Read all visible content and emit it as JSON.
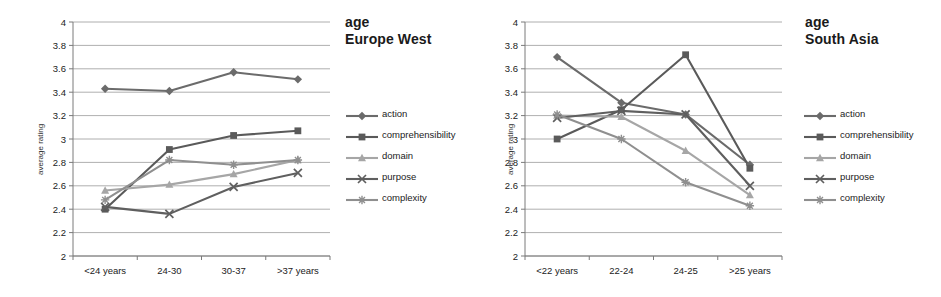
{
  "figure": {
    "panels": [
      {
        "id": "europe-west",
        "title_line1": "age",
        "title_line2": "Europe West"
      },
      {
        "id": "south-asia",
        "title_line1": "age",
        "title_line2": "South Asia"
      }
    ]
  },
  "legend": {
    "position": "right",
    "entries": [
      {
        "label": "action",
        "marker": "diamond",
        "color": "#6b6b6b"
      },
      {
        "label": "comprehensibility",
        "marker": "square",
        "color": "#5a5a5a"
      },
      {
        "label": "domain",
        "marker": "triangle",
        "color": "#a6a6a6"
      },
      {
        "label": "purpose",
        "marker": "cross",
        "color": "#5f5f5f"
      },
      {
        "label": "complexity",
        "marker": "asterisk",
        "color": "#8f8f8f"
      }
    ]
  },
  "chart_data": [
    {
      "type": "line",
      "title": "age Europe West",
      "xlabel": "",
      "ylabel": "average rating",
      "categories": [
        "<24 years",
        "24-30",
        "30-37",
        ">37 years"
      ],
      "ylim": [
        2,
        4
      ],
      "yticks": [
        "2",
        "2.2",
        "2.4",
        "2.6",
        "2.8",
        "3",
        "3.2",
        "3.4",
        "3.6",
        "3.8",
        "4"
      ],
      "ytick_values": [
        2,
        2.2,
        2.4,
        2.6,
        2.8,
        3,
        3.2,
        3.4,
        3.6,
        3.8,
        4
      ],
      "grid": true,
      "series": [
        {
          "name": "action",
          "marker": "diamond",
          "color": "#6b6b6b",
          "values": [
            3.43,
            3.41,
            3.57,
            3.51
          ]
        },
        {
          "name": "comprehensibility",
          "marker": "square",
          "color": "#5a5a5a",
          "values": [
            2.4,
            2.91,
            3.03,
            3.07
          ]
        },
        {
          "name": "domain",
          "marker": "triangle",
          "color": "#a6a6a6",
          "values": [
            2.56,
            2.61,
            2.7,
            2.82
          ]
        },
        {
          "name": "purpose",
          "marker": "cross",
          "color": "#5f5f5f",
          "values": [
            2.42,
            2.36,
            2.59,
            2.71
          ]
        },
        {
          "name": "complexity",
          "marker": "asterisk",
          "color": "#8f8f8f",
          "values": [
            2.48,
            2.82,
            2.78,
            2.82
          ]
        }
      ]
    },
    {
      "type": "line",
      "title": "age South Asia",
      "xlabel": "",
      "ylabel": "average rating",
      "categories": [
        "<22 years",
        "22-24",
        "24-25",
        ">25 years"
      ],
      "ylim": [
        2,
        4
      ],
      "yticks": [
        "2",
        "2.2",
        "2.4",
        "2.6",
        "2.8",
        "3",
        "3.2",
        "3.4",
        "3.6",
        "3.8",
        "4"
      ],
      "ytick_values": [
        2,
        2.2,
        2.4,
        2.6,
        2.8,
        3,
        3.2,
        3.4,
        3.6,
        3.8,
        4
      ],
      "grid": true,
      "series": [
        {
          "name": "action",
          "marker": "diamond",
          "color": "#6b6b6b",
          "values": [
            3.7,
            3.31,
            3.21,
            2.78
          ]
        },
        {
          "name": "comprehensibility",
          "marker": "square",
          "color": "#5a5a5a",
          "values": [
            3.0,
            3.25,
            3.72,
            2.75
          ]
        },
        {
          "name": "domain",
          "marker": "triangle",
          "color": "#a6a6a6",
          "values": [
            3.2,
            3.19,
            2.9,
            2.52
          ]
        },
        {
          "name": "purpose",
          "marker": "cross",
          "color": "#5f5f5f",
          "values": [
            3.18,
            3.24,
            3.21,
            2.6
          ]
        },
        {
          "name": "complexity",
          "marker": "asterisk",
          "color": "#8f8f8f",
          "values": [
            3.21,
            3.0,
            2.63,
            2.43
          ]
        }
      ]
    }
  ]
}
